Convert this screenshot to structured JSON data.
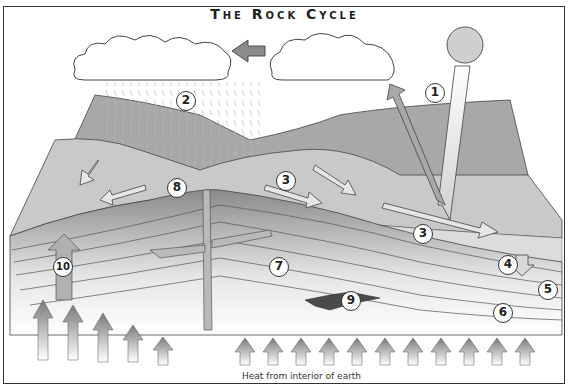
{
  "title": "The Rock Cycle",
  "caption": "Heat from interior of earth",
  "labels": [
    {
      "n": "1",
      "x": 425,
      "y": 83
    },
    {
      "n": "2",
      "x": 176,
      "y": 91
    },
    {
      "n": "3",
      "x": 276,
      "y": 171
    },
    {
      "n": "3",
      "x": 413,
      "y": 224
    },
    {
      "n": "4",
      "x": 498,
      "y": 255
    },
    {
      "n": "5",
      "x": 538,
      "y": 280
    },
    {
      "n": "6",
      "x": 493,
      "y": 303
    },
    {
      "n": "7",
      "x": 269,
      "y": 257
    },
    {
      "n": "8",
      "x": 167,
      "y": 178
    },
    {
      "n": "9",
      "x": 341,
      "y": 291
    },
    {
      "n": "10",
      "x": 53,
      "y": 257
    }
  ],
  "colors": {
    "sky": "#ffffff",
    "land_dark": "#9a9a9a",
    "land_light": "#c8c8c8",
    "rock_dark": "#6e6e6e",
    "rock_mid": "#8a8a8a",
    "magma": "#4a4a4a",
    "sea": "#d8d8d8",
    "arrow": "#8c8c8c",
    "sun": "#cfcfcf"
  }
}
